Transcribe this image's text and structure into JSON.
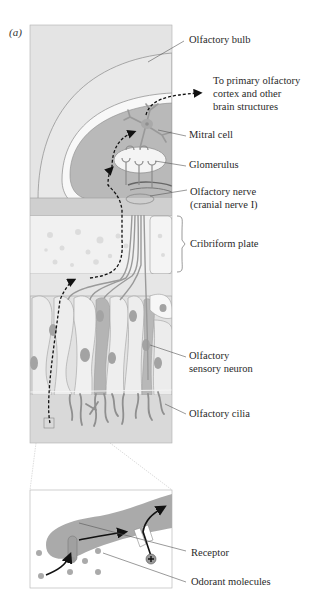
{
  "figure": {
    "panel_label": "(a)",
    "panel_letter": "a"
  },
  "labels": {
    "olfactory_bulb": "Olfactory bulb",
    "to_cortex_line1": "To primary olfactory",
    "to_cortex_line2": "cortex and other",
    "to_cortex_line3": "brain structures",
    "mitral_cell": "Mitral cell",
    "glomerulus": "Glomerulus",
    "olfactory_nerve_line1": "Olfactory nerve",
    "olfactory_nerve_line2": "(cranial nerve I)",
    "cribriform_plate": "Cribriform plate",
    "sensory_neuron_line1": "Olfactory",
    "sensory_neuron_line2": "sensory neuron",
    "olfactory_cilia": "Olfactory cilia",
    "receptor": "Receptor",
    "odorant_molecules": "Odorant molecules"
  },
  "colors": {
    "background": "#ffffff",
    "panel_bg": "#e4e4e4",
    "bulb_outer": "#e9e9e9",
    "bulb_inner": "#b9b9b9",
    "cell": "#d6d6d6",
    "nucleus": "#a3a3a3",
    "neuron": "#9a9a9a",
    "plate": "#f1f1f1",
    "text": "#2a2a2a",
    "leader": "#555555"
  }
}
